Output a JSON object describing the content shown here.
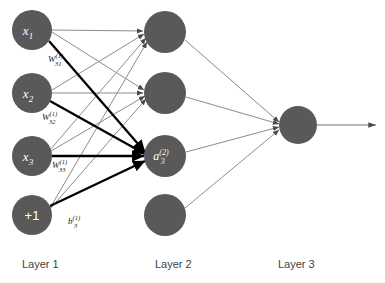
{
  "diagram": {
    "background_color": "#ffffff",
    "node_color": "#595959",
    "edge_color_thin": "#7f7f7f",
    "edge_color_bold": "#000000",
    "node_label_color": "#ffffff",
    "text_color": "#3f3f3f"
  },
  "layers": [
    {
      "name": "Layer 1",
      "label": "Layer 1",
      "label_x": 22,
      "label_y": 268,
      "nodes": [
        {
          "id": "x1",
          "main": "x",
          "sub": "1",
          "sup": "",
          "cx": 32,
          "cy": 30,
          "r": 20,
          "italic": true
        },
        {
          "id": "x2",
          "main": "x",
          "sub": "2",
          "sup": "",
          "cx": 32,
          "cy": 93,
          "r": 20,
          "italic": true
        },
        {
          "id": "x3",
          "main": "x",
          "sub": "3",
          "sup": "",
          "cx": 32,
          "cy": 156,
          "r": 20,
          "italic": true
        },
        {
          "id": "bias1",
          "main": "+1",
          "sub": "",
          "sup": "",
          "cx": 32,
          "cy": 215,
          "r": 20,
          "italic": false
        }
      ]
    },
    {
      "name": "Layer 2",
      "label": "Layer 2",
      "label_x": 155,
      "label_y": 268,
      "nodes": [
        {
          "id": "a1",
          "main": "",
          "sub": "",
          "sup": "",
          "cx": 165,
          "cy": 32,
          "r": 21,
          "italic": true
        },
        {
          "id": "a2",
          "main": "",
          "sub": "",
          "sup": "",
          "cx": 165,
          "cy": 93,
          "r": 21,
          "italic": true
        },
        {
          "id": "a3",
          "main": "a",
          "sub": "3",
          "sup": "(2)",
          "cx": 165,
          "cy": 156,
          "r": 21,
          "italic": true
        },
        {
          "id": "a4",
          "main": "",
          "sub": "",
          "sup": "",
          "cx": 165,
          "cy": 215,
          "r": 21,
          "italic": true
        }
      ]
    },
    {
      "name": "Layer 3",
      "label": "Layer 3",
      "label_x": 278,
      "label_y": 268,
      "nodes": [
        {
          "id": "out",
          "main": "",
          "sub": "",
          "sup": "",
          "cx": 298,
          "cy": 125,
          "r": 19,
          "italic": true
        }
      ]
    }
  ],
  "edge_labels": [
    {
      "id": "w31",
      "main": "W",
      "sub": "31",
      "sup": "(1)",
      "x": 48,
      "y": 62,
      "target": "a3"
    },
    {
      "id": "w32",
      "main": "W",
      "sub": "32",
      "sup": "(1)",
      "x": 42,
      "y": 120,
      "target": "a3"
    },
    {
      "id": "w33",
      "main": "W",
      "sub": "33",
      "sup": "(1)",
      "x": 52,
      "y": 168,
      "target": "a3"
    },
    {
      "id": "b3",
      "main": "b",
      "sub": "3",
      "sup": "(1)",
      "x": 68,
      "y": 224,
      "target": "a3"
    }
  ],
  "edges": {
    "bold_targets": [
      "a3"
    ],
    "layer1_to_layer2_count": 12,
    "layer2_to_layer3_count": 4,
    "output_arrow": {
      "from_x": 317,
      "to_x": 378,
      "y": 125
    }
  }
}
